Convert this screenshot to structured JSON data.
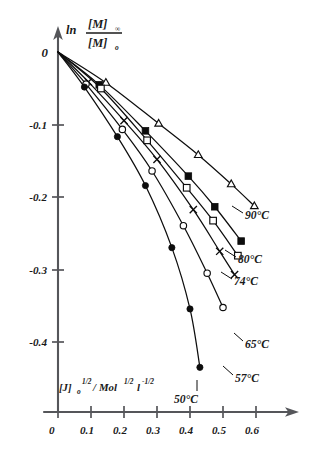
{
  "chart_data": {
    "type": "line",
    "title": "",
    "xlabel": "[J]0^1/2 / Mol^1/2 l^-1/2",
    "ylabel": "ln [M]inf / [M]0",
    "xlim": [
      0,
      0.675
    ],
    "ylim": [
      -0.47,
      0.012
    ],
    "xticks": [
      0,
      0.1,
      0.2,
      0.3,
      0.4,
      0.5,
      0.6
    ],
    "xticklabels": [
      "0",
      "0.1",
      "0.2",
      "0.3",
      "0.4",
      "0.5",
      "0.6"
    ],
    "yticks": [
      -0.1,
      -0.2,
      -0.3,
      -0.4
    ],
    "yticklabels": [
      "-0.1",
      "-0.2",
      "-0.3",
      "-0.4"
    ],
    "grid": false,
    "legend_position": "inline-right-of-curve-ends",
    "series": [
      {
        "name": "90°C",
        "label": "90°C",
        "marker": "open-triangle",
        "x": [
          0,
          0.145,
          0.305,
          0.425,
          0.525,
          0.595
        ],
        "y": [
          0,
          -0.042,
          -0.098,
          -0.141,
          -0.181,
          -0.211
        ]
      },
      {
        "name": "80°C",
        "label": "80°C",
        "marker": "filled-square",
        "x": [
          0,
          0.125,
          0.265,
          0.395,
          0.475,
          0.555
        ],
        "y": [
          0,
          -0.045,
          -0.108,
          -0.17,
          -0.212,
          -0.259
        ]
      },
      {
        "name": "74°C",
        "label": "74°C",
        "marker": "open-square",
        "x": [
          0,
          0.13,
          0.27,
          0.39,
          0.47,
          0.545
        ],
        "y": [
          0,
          -0.05,
          -0.121,
          -0.186,
          -0.231,
          -0.279
        ]
      },
      {
        "name": "65°C",
        "label": "65°C",
        "marker": "cross-x",
        "x": [
          0,
          0.092,
          0.2,
          0.3,
          0.41,
          0.49,
          0.535
        ],
        "y": [
          0,
          -0.041,
          -0.094,
          -0.147,
          -0.216,
          -0.273,
          -0.305
        ]
      },
      {
        "name": "57°C",
        "label": "57°C",
        "marker": "open-circle",
        "x": [
          0,
          0.085,
          0.195,
          0.285,
          0.38,
          0.452,
          0.5
        ],
        "y": [
          0,
          -0.044,
          -0.106,
          -0.163,
          -0.238,
          -0.303,
          -0.35
        ]
      },
      {
        "name": "50°C",
        "label": "50°C",
        "marker": "filled-circle",
        "x": [
          0,
          0.08,
          0.18,
          0.265,
          0.345,
          0.4,
          0.43
        ],
        "y": [
          0,
          -0.048,
          -0.116,
          -0.183,
          -0.268,
          -0.352,
          -0.432
        ]
      }
    ]
  },
  "axes": {
    "y_label_parts": {
      "ln": "ln",
      "num": "[M]",
      "num_sub": "∞",
      "den": "[M]",
      "den_sub": "o"
    },
    "x_label_parts": {
      "bracket": "[J]",
      "bracket_sub": "o",
      "bracket_sup": "1/2",
      "slash": "/",
      "mol": "Mol",
      "mol_sup": "1/2",
      "l": "l",
      "l_sup": "-1/2"
    },
    "origin_label": "0"
  }
}
